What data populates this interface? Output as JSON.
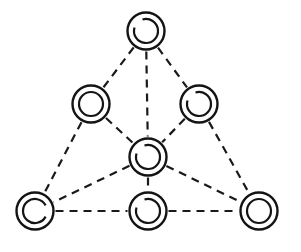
{
  "diagram": {
    "title": "",
    "style": {
      "background": "#ffffff",
      "stroke": "#141414",
      "edge_style": "dashed"
    },
    "node_radius": {
      "outer": 18.5,
      "inner": 12
    },
    "nodes": [
      {
        "id": "top",
        "x": 146,
        "y": 31,
        "inner_gap": "upper-left"
      },
      {
        "id": "upper-left",
        "x": 91,
        "y": 104,
        "inner_gap": "none"
      },
      {
        "id": "upper-right",
        "x": 199,
        "y": 104,
        "inner_gap": "upper-left"
      },
      {
        "id": "center",
        "x": 148,
        "y": 157,
        "inner_gap": "upper-left"
      },
      {
        "id": "bottom-left",
        "x": 35,
        "y": 211,
        "inner_gap": "right"
      },
      {
        "id": "bottom-middle",
        "x": 148,
        "y": 211,
        "inner_gap": "upper-left"
      },
      {
        "id": "bottom-right",
        "x": 259,
        "y": 211,
        "inner_gap": "none"
      }
    ],
    "edges": [
      {
        "from": "top",
        "to": "upper-left"
      },
      {
        "from": "top",
        "to": "center"
      },
      {
        "from": "top",
        "to": "upper-right"
      },
      {
        "from": "upper-left",
        "to": "center"
      },
      {
        "from": "upper-right",
        "to": "center"
      },
      {
        "from": "upper-left",
        "to": "bottom-left"
      },
      {
        "from": "upper-right",
        "to": "bottom-right"
      },
      {
        "from": "center",
        "to": "bottom-left"
      },
      {
        "from": "center",
        "to": "bottom-middle"
      },
      {
        "from": "center",
        "to": "bottom-right"
      },
      {
        "from": "bottom-left",
        "to": "bottom-middle"
      },
      {
        "from": "bottom-middle",
        "to": "bottom-right"
      }
    ]
  }
}
